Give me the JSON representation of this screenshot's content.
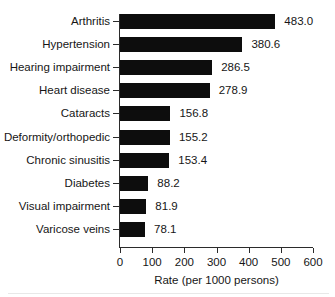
{
  "chart_data": {
    "type": "bar",
    "orientation": "horizontal",
    "title": "",
    "subtitle": "",
    "xlabel": "Rate (per 1000 persons)",
    "ylabel": "",
    "xlim": [
      0,
      600
    ],
    "xticks": [
      0,
      100,
      200,
      300,
      400,
      500,
      600
    ],
    "xtick_labels": [
      "0",
      "100",
      "200",
      "300",
      "400",
      "500",
      "600"
    ],
    "grid": false,
    "legend": null,
    "bar_color": "#0d0d0d",
    "axis_color": "#2b2b2b",
    "categories": [
      "Arthritis",
      "Hypertension",
      "Hearing impairment",
      "Heart disease",
      "Cataracts",
      "Deformity/orthopedic",
      "Chronic sinusitis",
      "Diabetes",
      "Visual impairment",
      "Varicose veins"
    ],
    "values": [
      483.0,
      380.6,
      286.5,
      278.9,
      156.8,
      155.2,
      153.4,
      88.2,
      81.9,
      78.1
    ],
    "value_labels": [
      "483.0",
      "380.6",
      "286.5",
      "278.9",
      "156.8",
      "155.2",
      "153.4",
      "88.2",
      "81.9",
      "78.1"
    ]
  }
}
